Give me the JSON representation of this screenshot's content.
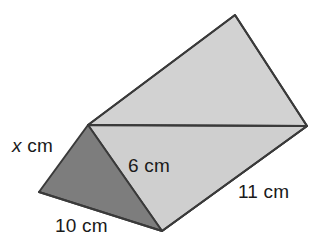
{
  "figure": {
    "shape_name": "triangular-prism",
    "background_color": "#ffffff",
    "stroke_color": "#3a3a3a",
    "faces": {
      "front_triangle": {
        "name": "front-triangular-face",
        "fill_color": "#7d7d7d",
        "points": "88,125 39,192 162,231"
      },
      "top_slant_rectangle": {
        "name": "upper-slanted-rectangular-face",
        "fill_color": "#d2d2d2",
        "points": "88,125 235,15 307,126 162,231"
      },
      "lower_right_rectangle": {
        "name": "lower-right-rectangular-face",
        "fill_color": "#cfcfcf",
        "points": "88,125 307,126 162,231"
      }
    },
    "edges": {
      "ridge": "88,125 307,126",
      "outline": "88,125 235,15 307,126 162,231 39,192"
    }
  },
  "labels": {
    "x": {
      "variable": "x",
      "unit": "cm",
      "full_text": "x cm",
      "edge": "slant-height-left-edge"
    },
    "six": {
      "value": "6",
      "unit": "cm",
      "full_text": "6 cm",
      "edge": "slant-height-right-edge"
    },
    "ten": {
      "value": "10",
      "unit": "cm",
      "full_text": "10 cm",
      "edge": "triangle-base-edge"
    },
    "eleven": {
      "value": "11",
      "unit": "cm",
      "full_text": "11 cm",
      "edge": "prism-length-edge"
    }
  }
}
